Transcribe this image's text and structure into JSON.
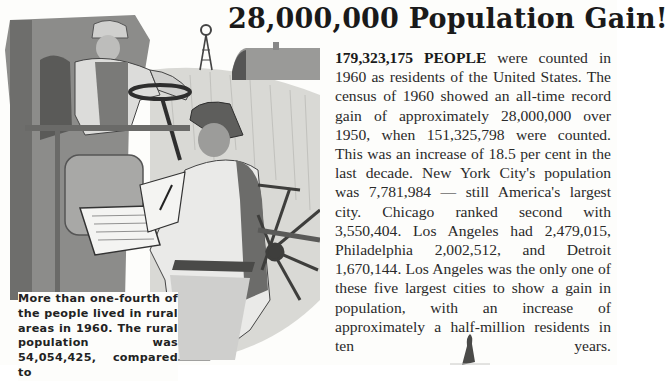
{
  "headline": "28,000,000 Population Gain!",
  "body": {
    "lead": "179,323,175 PEOPLE",
    "text": " were counted in 1960 as residents of the United States. The census of 1960 showed an all-time record gain of approximately 28,000,000 over 1950, when 151,325,798 were counted. This was an increase of 18.5 per cent in the last decade. New York City's population was 7,781,984 — still America's largest city. Chicago ranked second with 3,550,404. Los Angeles had 2,479,015, Philadelphia 2,002,512, and Detroit 1,670,144. Los Angeles was the only one of these five largest cities to show a gain in population, with an increase of approximately a half-million residents in ten years."
  },
  "caption": "More than one-fourth of the people lived in rural areas in 1960. The rural population was 54,054,425, compared to",
  "illustration": {
    "description": "Farmer on a combine harvester talking to a census taker holding a clipboard, wheat field with windmill and barn in background",
    "colors": {
      "sky": "#fdfdfb",
      "wheat": "#d6d6d2",
      "machine": "#8a8a88",
      "dark": "#3a3a3a",
      "shirt": "#eeeeec"
    }
  }
}
